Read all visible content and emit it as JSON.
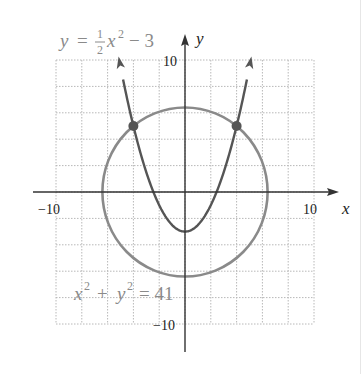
{
  "chart_data": {
    "type": "line",
    "title": "",
    "xlabel": "x",
    "ylabel": "y",
    "xlim": [
      -10,
      10
    ],
    "ylim": [
      -10,
      10
    ],
    "grid": true,
    "grid_step": 2,
    "tick_labels": {
      "x": [
        {
          "value": -10,
          "label": "−10"
        },
        {
          "value": 10,
          "label": "10"
        }
      ],
      "y": [
        {
          "value": 10,
          "label": "10"
        },
        {
          "value": -10,
          "label": "−10"
        }
      ]
    },
    "series": [
      {
        "name": "parabola",
        "equation": "y = (1/2)x^2 - 3",
        "kind": "function",
        "color": "#555555",
        "x_range": [
          -5.15,
          5.15
        ],
        "arrows": true,
        "vertex": [
          0,
          -3
        ]
      },
      {
        "name": "circle",
        "equation": "x^2 + y^2 = 41",
        "kind": "circle",
        "center": [
          0,
          0
        ],
        "radius": 6.403,
        "color": "#8a8a8a"
      }
    ],
    "points": [
      {
        "x": -4,
        "y": 5,
        "label": "intersection"
      },
      {
        "x": 4,
        "y": 5,
        "label": "intersection"
      }
    ],
    "annotations": [
      {
        "text": "parabola-label",
        "near": [
          -6.5,
          11.5
        ]
      },
      {
        "text": "circle-label",
        "near": [
          -5,
          -8
        ]
      }
    ]
  },
  "labels": {
    "parabola_eq": {
      "y": "y",
      "eq": "=",
      "num": "1",
      "den": "2",
      "x": "x",
      "exp": "2",
      "rest": "− 3"
    },
    "circle_eq": {
      "x": "x",
      "xexp": "2",
      "plus": "+",
      "y": "y",
      "yexp": "2",
      "rest": "= 41"
    },
    "axis_x": "x",
    "axis_y": "y",
    "tick_x_neg": "−10",
    "tick_x_pos": "10",
    "tick_y_pos": "10",
    "tick_y_neg": "−10"
  },
  "colors": {
    "grid": "#b8b8b8",
    "axis": "#333333",
    "parabola": "#555555",
    "circle": "#8a8a8a",
    "label": "#8a8a8a",
    "tick": "#222222",
    "point": "#555555"
  }
}
